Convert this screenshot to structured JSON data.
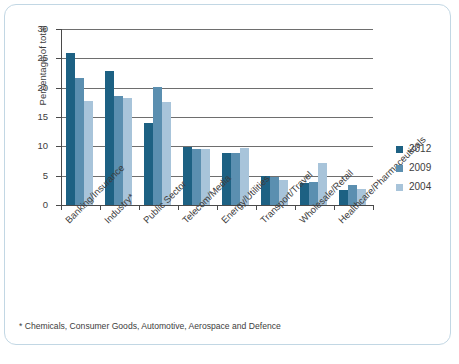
{
  "chart_data": {
    "type": "bar",
    "title": "",
    "subtitle": "",
    "xlabel": "",
    "ylabel": "Percentage of total",
    "ylim": [
      0,
      30
    ],
    "ytick_labels": [
      "0",
      "5",
      "10",
      "15",
      "20",
      "25",
      "30"
    ],
    "ytick_values": [
      0,
      5,
      10,
      15,
      20,
      25,
      30
    ],
    "grid": true,
    "grid_axis": "y",
    "legend_position": "right",
    "categories": [
      "Banking/Insurance",
      "Industry*",
      "Public Sector",
      "Telecom/Media",
      "Energy/Utilities",
      "Transport/Travel",
      "Wholesale/Retail",
      "Healthcare/Pharmaceuticals"
    ],
    "series": [
      {
        "name": "2012",
        "color": "#1d6183",
        "values": [
          25.9,
          22.9,
          13.9,
          9.9,
          8.8,
          4.9,
          3.7,
          2.6
        ]
      },
      {
        "name": "2009",
        "color": "#5b8fb0",
        "values": [
          21.7,
          18.6,
          20.1,
          9.5,
          8.8,
          4.7,
          4.0,
          3.4
        ]
      },
      {
        "name": "2004",
        "color": "#a8c4da",
        "values": [
          17.7,
          18.3,
          17.6,
          9.5,
          9.8,
          4.2,
          7.1,
          2.7
        ]
      }
    ],
    "annotations": [
      "* Chemicals, Consumer Goods, Automotive, Aerospace and Defence"
    ]
  },
  "footnote": "* Chemicals, Consumer Goods, Automotive, Aerospace and Defence",
  "colors": {
    "series_2012": "#1d6183",
    "series_2009": "#5b8fb0",
    "series_2004": "#a8c4da",
    "frame_border": "#c2d7e4",
    "axis": "#4a4a4a",
    "gridline": "#6e6e6e",
    "text": "#3d3d3d",
    "background": "#ffffff"
  }
}
